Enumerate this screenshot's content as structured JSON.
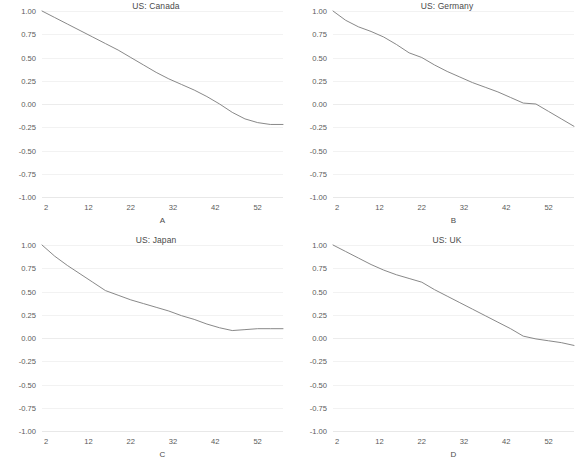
{
  "figure": {
    "name": "us-correlation-panels",
    "layout": "2x2",
    "background_color": "#ffffff",
    "line_color": "#7a7a7a",
    "grid_color": "#f2f2f2",
    "text_color": "#555555"
  },
  "panels": [
    {
      "id": "A",
      "position": "top-left",
      "title": "US: Canada",
      "axis_label": "A"
    },
    {
      "id": "B",
      "position": "top-right",
      "title": "US: Germany",
      "axis_label": "B"
    },
    {
      "id": "C",
      "position": "bottom-left",
      "title": "US: Japan",
      "axis_label": "C"
    },
    {
      "id": "D",
      "position": "bottom-right",
      "title": "US: UK",
      "axis_label": "D"
    }
  ],
  "chart_data": [
    {
      "type": "line",
      "title": "US: Canada",
      "xlabel": "A",
      "ylabel": "",
      "xlim": [
        1,
        58
      ],
      "ylim": [
        -1.0,
        1.0
      ],
      "grid": true,
      "legend": "none",
      "xticks": [
        2,
        12,
        22,
        32,
        42,
        52
      ],
      "ytick_labels": [
        "1.00",
        "0.75",
        "0.50",
        "0.25",
        "0.00",
        "-0.25",
        "-0.50",
        "-0.75",
        "-1.00"
      ],
      "yticks": [
        1.0,
        0.75,
        0.5,
        0.25,
        0.0,
        -0.25,
        -0.5,
        -0.75,
        -1.0
      ],
      "x": [
        1,
        4,
        7,
        10,
        13,
        16,
        19,
        22,
        25,
        28,
        31,
        34,
        37,
        40,
        43,
        46,
        49,
        52,
        55,
        58
      ],
      "values": [
        1.0,
        0.93,
        0.86,
        0.79,
        0.72,
        0.65,
        0.58,
        0.5,
        0.42,
        0.34,
        0.27,
        0.21,
        0.15,
        0.08,
        0.0,
        -0.09,
        -0.16,
        -0.2,
        -0.22,
        -0.22
      ]
    },
    {
      "type": "line",
      "title": "US: Germany",
      "xlabel": "B",
      "ylabel": "",
      "xlim": [
        1,
        58
      ],
      "ylim": [
        -1.0,
        1.0
      ],
      "grid": true,
      "legend": "none",
      "xticks": [
        2,
        12,
        22,
        32,
        42,
        52
      ],
      "ytick_labels": [
        "1.00",
        "0.75",
        "0.50",
        "0.25",
        "0.00",
        "-0.25",
        "-0.50",
        "-0.75",
        "-1.00"
      ],
      "yticks": [
        1.0,
        0.75,
        0.5,
        0.25,
        0.0,
        -0.25,
        -0.5,
        -0.75,
        -1.0
      ],
      "x": [
        1,
        4,
        7,
        10,
        13,
        16,
        19,
        22,
        25,
        28,
        31,
        34,
        37,
        40,
        43,
        46,
        49,
        52,
        55,
        58
      ],
      "values": [
        1.0,
        0.9,
        0.83,
        0.78,
        0.72,
        0.64,
        0.55,
        0.5,
        0.42,
        0.35,
        0.29,
        0.23,
        0.18,
        0.13,
        0.07,
        0.01,
        0.0,
        -0.08,
        -0.16,
        -0.24
      ]
    },
    {
      "type": "line",
      "title": "US: Japan",
      "xlabel": "C",
      "ylabel": "",
      "xlim": [
        1,
        58
      ],
      "ylim": [
        -1.0,
        1.0
      ],
      "grid": true,
      "legend": "none",
      "xticks": [
        2,
        12,
        22,
        32,
        42,
        52
      ],
      "ytick_labels": [
        "1.00",
        "0.75",
        "0.50",
        "0.25",
        "0.00",
        "-0.25",
        "-0.50",
        "-0.75",
        "-1.00"
      ],
      "yticks": [
        1.0,
        0.75,
        0.5,
        0.25,
        0.0,
        -0.25,
        -0.5,
        -0.75,
        -1.0
      ],
      "x": [
        1,
        4,
        7,
        10,
        13,
        16,
        19,
        22,
        25,
        28,
        31,
        34,
        37,
        40,
        43,
        46,
        49,
        52,
        55,
        58
      ],
      "values": [
        1.0,
        0.88,
        0.78,
        0.69,
        0.6,
        0.51,
        0.46,
        0.41,
        0.37,
        0.33,
        0.29,
        0.24,
        0.2,
        0.15,
        0.11,
        0.08,
        0.09,
        0.1,
        0.1,
        0.1
      ]
    },
    {
      "type": "line",
      "title": "US: UK",
      "xlabel": "D",
      "ylabel": "",
      "xlim": [
        1,
        58
      ],
      "ylim": [
        -1.0,
        1.0
      ],
      "grid": true,
      "legend": "none",
      "xticks": [
        2,
        12,
        22,
        32,
        42,
        52
      ],
      "ytick_labels": [
        "1.00",
        "0.75",
        "0.50",
        "0.25",
        "0.00",
        "-0.25",
        "-0.50",
        "-0.75",
        "-1.00"
      ],
      "yticks": [
        1.0,
        0.75,
        0.5,
        0.25,
        0.0,
        -0.25,
        -0.5,
        -0.75,
        -1.0
      ],
      "x": [
        1,
        4,
        7,
        10,
        13,
        16,
        19,
        22,
        25,
        28,
        31,
        34,
        37,
        40,
        43,
        46,
        49,
        52,
        55,
        58
      ],
      "values": [
        1.0,
        0.93,
        0.86,
        0.79,
        0.73,
        0.68,
        0.64,
        0.6,
        0.52,
        0.45,
        0.38,
        0.31,
        0.24,
        0.17,
        0.1,
        0.02,
        -0.01,
        -0.03,
        -0.05,
        -0.08
      ]
    }
  ]
}
